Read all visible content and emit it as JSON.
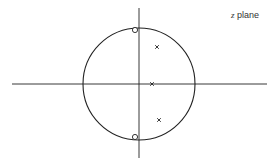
{
  "title": "z plane",
  "label": {
    "var": "z",
    "word": "plane"
  },
  "colors": {
    "stroke": "#222222",
    "background": "#ffffff",
    "text": "#333333"
  },
  "axes": {
    "horizontal": {
      "x1": 12,
      "x2": 267,
      "y": 84
    },
    "vertical": {
      "x": 139,
      "y1": 8,
      "y2": 158
    }
  },
  "unit_circle": {
    "cx": 139,
    "cy": 84,
    "r": 56
  },
  "zeros": [
    {
      "x": 135,
      "y": 30
    },
    {
      "x": 135,
      "y": 137
    }
  ],
  "poles": [
    {
      "x": 157,
      "y": 47
    },
    {
      "x": 152,
      "y": 84
    },
    {
      "x": 159,
      "y": 120
    }
  ]
}
